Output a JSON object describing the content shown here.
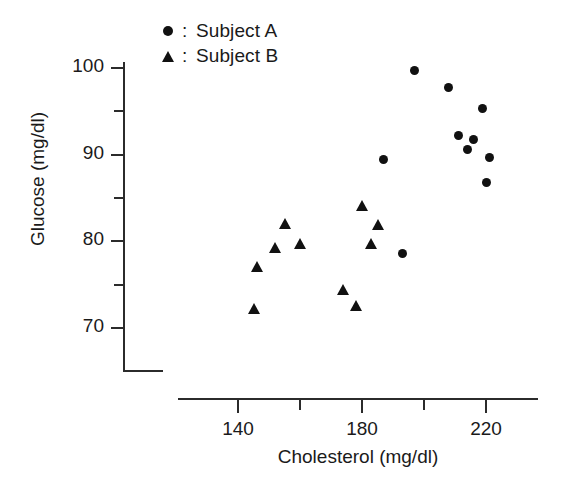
{
  "chart_data": {
    "type": "scatter",
    "title": "",
    "xlabel": "Cholesterol (mg/dl)",
    "ylabel": "Glucose (mg/dl)",
    "xlim": [
      128,
      230
    ],
    "ylim": [
      67,
      103
    ],
    "grid": false,
    "legend_position": "top-left-inside",
    "x_major_ticks": [
      140,
      180,
      220
    ],
    "x_minor_ticks": [
      160,
      200
    ],
    "x_tick_labels": [
      "140",
      "180",
      "220"
    ],
    "y_major_ticks": [
      100,
      90,
      80,
      70
    ],
    "y_minor_ticks": [
      95,
      85,
      75
    ],
    "y_tick_labels": [
      "100",
      "90",
      "80",
      "70"
    ],
    "marker_color": "#111111",
    "axis_color": "#2b2b2b",
    "broken_axis": true,
    "series": [
      {
        "name": "Subject A",
        "marker": "circle",
        "points": [
          {
            "x": 197,
            "y": 99.7
          },
          {
            "x": 208,
            "y": 97.8
          },
          {
            "x": 219,
            "y": 95.3
          },
          {
            "x": 211,
            "y": 92.2
          },
          {
            "x": 216,
            "y": 91.7
          },
          {
            "x": 214,
            "y": 90.6
          },
          {
            "x": 221,
            "y": 89.7
          },
          {
            "x": 187,
            "y": 89.4
          },
          {
            "x": 220,
            "y": 86.8
          },
          {
            "x": 193,
            "y": 78.6
          }
        ]
      },
      {
        "name": "Subject B",
        "marker": "triangle",
        "points": [
          {
            "x": 180,
            "y": 84.1
          },
          {
            "x": 155,
            "y": 82.1
          },
          {
            "x": 185,
            "y": 81.9
          },
          {
            "x": 160,
            "y": 79.8
          },
          {
            "x": 152,
            "y": 79.3
          },
          {
            "x": 183,
            "y": 79.7
          },
          {
            "x": 146,
            "y": 77.1
          },
          {
            "x": 174,
            "y": 74.4
          },
          {
            "x": 178,
            "y": 72.6
          },
          {
            "x": 145,
            "y": 72.2
          }
        ]
      }
    ]
  },
  "legend": {
    "separator": ":",
    "entries": [
      {
        "marker": "circle",
        "label": "Subject A"
      },
      {
        "marker": "triangle",
        "label": "Subject B"
      }
    ]
  },
  "axes": {
    "x_title": "Cholesterol (mg/dl)",
    "y_title": "Glucose (mg/dl)"
  }
}
